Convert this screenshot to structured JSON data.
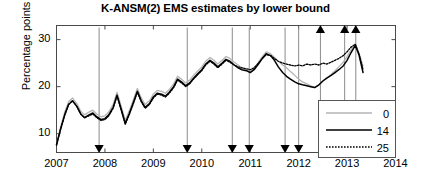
{
  "chart_data": {
    "type": "line",
    "title": "K-ANSM(2) EMS estimates by lower bound",
    "xlabel": "",
    "ylabel": "Percentage points",
    "xlim": [
      2007,
      2014
    ],
    "ylim": [
      6,
      33
    ],
    "yticks": [
      10,
      20,
      30
    ],
    "xticks": [
      2007,
      2008,
      2009,
      2010,
      2011,
      2012,
      2013,
      2014
    ],
    "grid": false,
    "legend_position": "lower right",
    "legend_title": "",
    "series": [
      {
        "name": "0",
        "label": "0",
        "color": "#b4b4b4",
        "style": "solid",
        "x": [
          2007.0,
          2007.08,
          2007.17,
          2007.25,
          2007.33,
          2007.42,
          2007.5,
          2007.58,
          2007.67,
          2007.75,
          2007.83,
          2007.92,
          2008.0,
          2008.08,
          2008.17,
          2008.25,
          2008.33,
          2008.42,
          2008.5,
          2008.58,
          2008.67,
          2008.75,
          2008.83,
          2008.92,
          2009.0,
          2009.08,
          2009.17,
          2009.25,
          2009.33,
          2009.42,
          2009.5,
          2009.58,
          2009.67,
          2009.75,
          2009.83,
          2009.92,
          2010.0,
          2010.08,
          2010.17,
          2010.25,
          2010.33,
          2010.42,
          2010.5,
          2010.58,
          2010.67,
          2010.75,
          2010.83,
          2010.92,
          2011.0,
          2011.08,
          2011.17,
          2011.25,
          2011.33,
          2011.42,
          2011.5,
          2011.58,
          2011.67,
          2011.75,
          2011.83,
          2011.92,
          2012.0,
          2012.08,
          2012.17,
          2012.25,
          2012.33,
          2012.42,
          2012.5,
          2012.58,
          2012.67,
          2012.75,
          2012.83,
          2012.92,
          2013.0,
          2013.08,
          2013.17,
          2013.25,
          2013.33
        ],
        "y": [
          7.8,
          11.2,
          14.6,
          16.8,
          17.6,
          16.4,
          14.8,
          14.0,
          14.6,
          15.0,
          14.2,
          13.6,
          13.8,
          14.6,
          16.2,
          18.8,
          16.0,
          12.8,
          14.8,
          17.0,
          19.6,
          17.6,
          16.2,
          17.0,
          18.4,
          19.2,
          19.0,
          18.6,
          19.4,
          20.6,
          22.2,
          21.6,
          20.8,
          21.4,
          22.4,
          23.4,
          24.2,
          25.4,
          26.2,
          25.6,
          24.8,
          25.6,
          26.4,
          26.0,
          25.2,
          24.6,
          24.0,
          23.6,
          23.2,
          23.8,
          25.2,
          26.4,
          27.4,
          27.0,
          26.2,
          25.4,
          24.6,
          24.0,
          23.2,
          22.4,
          21.6,
          21.0,
          20.6,
          20.2,
          19.8,
          20.4,
          21.2,
          21.8,
          22.6,
          23.4,
          24.2,
          25.2,
          26.4,
          27.8,
          29.2,
          27.0,
          24.4
        ]
      },
      {
        "name": "14",
        "label": "14",
        "color": "#000000",
        "style": "solid",
        "x": [
          2007.0,
          2007.08,
          2007.17,
          2007.25,
          2007.33,
          2007.42,
          2007.5,
          2007.58,
          2007.67,
          2007.75,
          2007.83,
          2007.92,
          2008.0,
          2008.08,
          2008.17,
          2008.25,
          2008.33,
          2008.42,
          2008.5,
          2008.58,
          2008.67,
          2008.75,
          2008.83,
          2008.92,
          2009.0,
          2009.08,
          2009.17,
          2009.25,
          2009.33,
          2009.42,
          2009.5,
          2009.58,
          2009.67,
          2009.75,
          2009.83,
          2009.92,
          2010.0,
          2010.08,
          2010.17,
          2010.25,
          2010.33,
          2010.42,
          2010.5,
          2010.58,
          2010.67,
          2010.75,
          2010.83,
          2010.92,
          2011.0,
          2011.08,
          2011.17,
          2011.25,
          2011.33,
          2011.42,
          2011.5,
          2011.58,
          2011.67,
          2011.75,
          2011.83,
          2011.92,
          2012.0,
          2012.08,
          2012.17,
          2012.25,
          2012.33,
          2012.42,
          2012.5,
          2012.58,
          2012.67,
          2012.75,
          2012.83,
          2012.92,
          2013.0,
          2013.08,
          2013.17,
          2013.25,
          2013.33
        ],
        "y": [
          7.6,
          10.8,
          14.0,
          16.2,
          17.0,
          15.8,
          14.2,
          13.4,
          14.0,
          14.4,
          13.6,
          13.0,
          13.2,
          14.0,
          15.6,
          18.2,
          15.4,
          12.2,
          14.2,
          16.4,
          19.0,
          17.0,
          15.6,
          16.4,
          17.8,
          18.6,
          18.4,
          18.0,
          18.8,
          20.0,
          21.6,
          21.0,
          20.2,
          20.8,
          21.8,
          22.8,
          23.6,
          24.8,
          25.6,
          25.0,
          24.2,
          25.0,
          25.8,
          25.4,
          24.6,
          24.0,
          23.6,
          23.4,
          23.0,
          23.6,
          24.8,
          26.0,
          27.0,
          26.6,
          25.6,
          24.2,
          23.0,
          22.2,
          21.6,
          21.0,
          20.6,
          20.4,
          20.2,
          20.0,
          19.8,
          20.4,
          21.2,
          21.8,
          22.4,
          23.0,
          23.6,
          24.4,
          25.6,
          27.2,
          28.8,
          26.6,
          23.0
        ]
      },
      {
        "name": "25",
        "label": "25",
        "color": "#000000",
        "style": "dotted",
        "x": [
          2007.0,
          2007.08,
          2007.17,
          2007.25,
          2007.33,
          2007.42,
          2007.5,
          2007.58,
          2007.67,
          2007.75,
          2007.83,
          2007.92,
          2008.0,
          2008.08,
          2008.17,
          2008.25,
          2008.33,
          2008.42,
          2008.5,
          2008.58,
          2008.67,
          2008.75,
          2008.83,
          2008.92,
          2009.0,
          2009.08,
          2009.17,
          2009.25,
          2009.33,
          2009.42,
          2009.5,
          2009.58,
          2009.67,
          2009.75,
          2009.83,
          2009.92,
          2010.0,
          2010.08,
          2010.17,
          2010.25,
          2010.33,
          2010.42,
          2010.5,
          2010.58,
          2010.67,
          2010.75,
          2010.83,
          2010.92,
          2011.0,
          2011.08,
          2011.17,
          2011.25,
          2011.33,
          2011.42,
          2011.5,
          2011.58,
          2011.67,
          2011.75,
          2011.83,
          2011.92,
          2012.0,
          2012.08,
          2012.17,
          2012.25,
          2012.33,
          2012.42,
          2012.5,
          2012.58,
          2012.67,
          2012.75,
          2012.83,
          2012.92,
          2013.0,
          2013.08,
          2013.17,
          2013.25,
          2013.33
        ],
        "y": [
          7.6,
          10.8,
          14.0,
          16.2,
          17.0,
          15.8,
          14.2,
          13.4,
          13.8,
          14.2,
          13.4,
          12.8,
          13.0,
          13.8,
          15.4,
          18.0,
          15.2,
          12.0,
          14.0,
          16.2,
          18.8,
          16.8,
          15.4,
          16.2,
          17.6,
          18.4,
          18.2,
          17.8,
          18.6,
          19.8,
          21.4,
          20.8,
          20.0,
          20.6,
          21.6,
          22.6,
          23.4,
          24.6,
          25.4,
          24.8,
          24.0,
          24.8,
          25.6,
          25.2,
          24.6,
          24.2,
          24.0,
          23.8,
          23.6,
          24.0,
          25.0,
          26.0,
          26.8,
          26.6,
          26.0,
          25.4,
          25.0,
          24.8,
          24.6,
          24.4,
          24.6,
          24.4,
          24.8,
          24.6,
          24.8,
          24.6,
          25.0,
          24.8,
          25.2,
          25.6,
          26.0,
          26.6,
          27.4,
          28.4,
          29.0,
          26.8,
          23.6
        ]
      }
    ],
    "down_arrow_years": [
      2007.88,
      2009.7,
      2010.63,
      2010.98,
      2011.72,
      2012.0
    ],
    "up_arrow_years": [
      2012.45,
      2012.95,
      2013.18
    ],
    "annotations": "Vertical marker lines with triangular arrowheads mark event dates; downward arrows sit on the x-axis, upward arrows at the top of the axes."
  }
}
